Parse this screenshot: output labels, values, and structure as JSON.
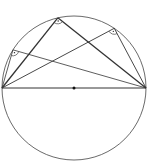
{
  "diagram": {
    "stroke_color": "#333333",
    "circle": {
      "label": "circle"
    },
    "diameter": {
      "label": "diameter"
    },
    "center": {
      "label": "center point"
    },
    "vertices": [
      {
        "name": "apex-top",
        "angle_deg": 103
      },
      {
        "name": "apex-right",
        "angle_deg": 56
      },
      {
        "name": "apex-left",
        "angle_deg": 148
      }
    ],
    "right_angle_marker": "dot-in-arc"
  }
}
